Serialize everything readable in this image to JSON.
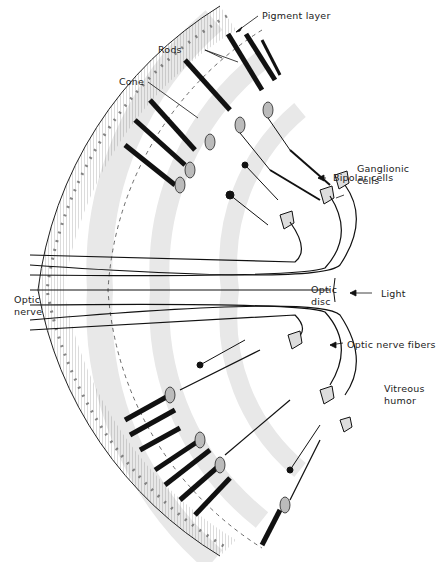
{
  "labels": {
    "pigment_layer": "Pigment layer",
    "rods": "Rods",
    "cone": "Cone",
    "bipolar_cells": "Bipolar cells",
    "ganglionic_cells_1": "Ganglionic",
    "ganglionic_cells_2": "cells",
    "optic_disc_1": "Optic",
    "optic_disc_2": "disc",
    "light": "Light",
    "optic_nerve_1": "Optic",
    "optic_nerve_2": "nerve",
    "optic_nerve_fibers": "Optic nerve fibers",
    "vitreous_humor_1": "Vitreous",
    "vitreous_humor_2": "humor"
  },
  "colors": {
    "ink": "#1a1a1a",
    "shade": "#e6e6e6",
    "background": "#ffffff"
  }
}
